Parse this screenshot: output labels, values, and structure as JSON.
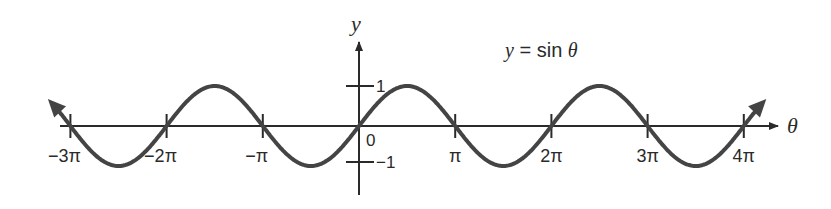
{
  "title": "y = sin θ",
  "axes": {
    "x_label": "θ",
    "y_label": "y",
    "origin_label": "0",
    "y_ticks": [
      {
        "value": 1,
        "label": "1"
      },
      {
        "value": -1,
        "label": "−1"
      }
    ],
    "x_ticks": [
      {
        "value": "-3π",
        "label": "−3π"
      },
      {
        "value": "-2π",
        "label": "−2π"
      },
      {
        "value": "-π",
        "label": "−π"
      },
      {
        "value": "π",
        "label": "π"
      },
      {
        "value": "2π",
        "label": "2π"
      },
      {
        "value": "3π",
        "label": "3π"
      },
      {
        "value": "4π",
        "label": "4π"
      }
    ]
  },
  "colors": {
    "curve": "#444444",
    "axis": "#2a2a2a",
    "background": "#ffffff"
  },
  "chart_data": {
    "type": "line",
    "title": "y = sin θ",
    "xlabel": "θ",
    "ylabel": "y",
    "function": "sin",
    "x_range": [
      "-3.1π",
      "4.2π"
    ],
    "y_range": [
      -1,
      1
    ],
    "x_tick_labels": [
      "−3π",
      "−2π",
      "−π",
      "0",
      "π",
      "2π",
      "3π",
      "4π"
    ],
    "y_tick_labels": [
      "1",
      "−1"
    ],
    "zeros": [
      "-3π",
      "-2π",
      "-π",
      "0",
      "π",
      "2π",
      "3π",
      "4π"
    ],
    "maxima_at": [
      "-3π/2",
      "π/2",
      "5π/2"
    ],
    "minima_at": [
      "-5π/2",
      "-π/2",
      "3π/2",
      "7π/2"
    ],
    "grid": false,
    "legend": "none"
  }
}
